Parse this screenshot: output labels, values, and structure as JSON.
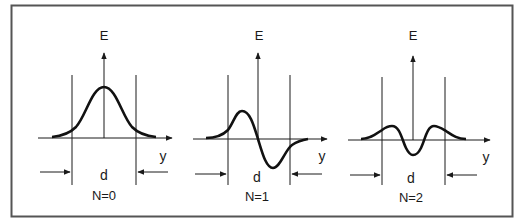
{
  "figure": {
    "frame_color": "#555555",
    "line_color": "#1a1a1a",
    "curve_color": "#111111",
    "panels": [
      {
        "axis_label_e": "E",
        "axis_label_y": "y",
        "width_label": "d",
        "mode_label": "N=0"
      },
      {
        "axis_label_e": "E",
        "axis_label_y": "y",
        "width_label": "d",
        "mode_label": "N=1"
      },
      {
        "axis_label_e": "E",
        "axis_label_y": "y",
        "width_label": "d",
        "mode_label": "N=2"
      }
    ]
  }
}
